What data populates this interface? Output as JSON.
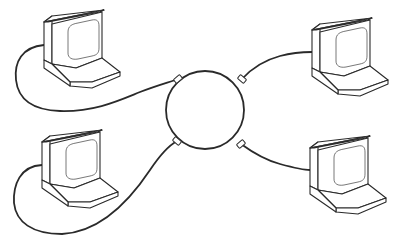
{
  "diagram": {
    "title": "Token ring network",
    "topology": "ring",
    "colors": {
      "line": "#2a2a2a",
      "background": "#ffffff"
    },
    "ring": {
      "label": "ring",
      "cx": 205,
      "cy": 110,
      "r": 39
    },
    "nodes": [
      {
        "id": "pc-top-left",
        "label": "computer",
        "position": "top-left"
      },
      {
        "id": "pc-top-right",
        "label": "computer",
        "position": "top-right"
      },
      {
        "id": "pc-bottom-left",
        "label": "computer",
        "position": "bottom-left"
      },
      {
        "id": "pc-bottom-right",
        "label": "computer",
        "position": "bottom-right"
      }
    ],
    "connectors": [
      {
        "id": "conn-top-left",
        "x": 178,
        "y": 79
      },
      {
        "id": "conn-top-right",
        "x": 242,
        "y": 79
      },
      {
        "id": "conn-bottom-left",
        "x": 177,
        "y": 141
      },
      {
        "id": "conn-bottom-right",
        "x": 241,
        "y": 144
      }
    ],
    "edges": [
      {
        "from": "pc-top-left",
        "to": "conn-top-left"
      },
      {
        "from": "pc-top-right",
        "to": "conn-top-right"
      },
      {
        "from": "pc-bottom-left",
        "to": "conn-bottom-left"
      },
      {
        "from": "pc-bottom-right",
        "to": "conn-bottom-right"
      }
    ]
  }
}
